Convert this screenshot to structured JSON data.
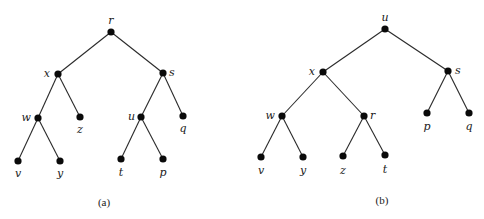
{
  "diagram": {
    "type": "binary-trees",
    "trees": [
      {
        "id": "a",
        "caption": "(a)",
        "caption_pos": [
          104,
          206
        ],
        "nodes": [
          {
            "id": "r",
            "label": "r",
            "x": 111,
            "y": 32,
            "lx": 111,
            "ly": 24,
            "anchor": "middle"
          },
          {
            "id": "x",
            "label": "x",
            "x": 58,
            "y": 74,
            "lx": 50,
            "ly": 77,
            "anchor": "end"
          },
          {
            "id": "s",
            "label": "s",
            "x": 163,
            "y": 73,
            "lx": 169,
            "ly": 76,
            "anchor": "start"
          },
          {
            "id": "w",
            "label": "w",
            "x": 38,
            "y": 118,
            "lx": 31,
            "ly": 121,
            "anchor": "end"
          },
          {
            "id": "z",
            "label": "z",
            "x": 80,
            "y": 117,
            "lx": 80,
            "ly": 133,
            "anchor": "middle"
          },
          {
            "id": "u",
            "label": "u",
            "x": 141,
            "y": 117,
            "lx": 135,
            "ly": 120,
            "anchor": "end"
          },
          {
            "id": "q",
            "label": "q",
            "x": 183,
            "y": 116,
            "lx": 183,
            "ly": 132,
            "anchor": "middle"
          },
          {
            "id": "v",
            "label": "v",
            "x": 18,
            "y": 161,
            "lx": 18,
            "ly": 177,
            "anchor": "middle"
          },
          {
            "id": "y",
            "label": "y",
            "x": 60,
            "y": 161,
            "lx": 60,
            "ly": 177,
            "anchor": "middle"
          },
          {
            "id": "t",
            "label": "t",
            "x": 121,
            "y": 159,
            "lx": 121,
            "ly": 176,
            "anchor": "middle"
          },
          {
            "id": "p",
            "label": "p",
            "x": 163,
            "y": 159,
            "lx": 163,
            "ly": 176,
            "anchor": "middle"
          }
        ],
        "edges": [
          [
            "r",
            "x"
          ],
          [
            "r",
            "s"
          ],
          [
            "x",
            "w"
          ],
          [
            "x",
            "z"
          ],
          [
            "w",
            "v"
          ],
          [
            "w",
            "y"
          ],
          [
            "s",
            "u"
          ],
          [
            "s",
            "q"
          ],
          [
            "u",
            "t"
          ],
          [
            "u",
            "p"
          ]
        ]
      },
      {
        "id": "b",
        "caption": "(b)",
        "caption_pos": [
          382,
          204
        ],
        "nodes": [
          {
            "id": "u",
            "label": "u",
            "x": 385,
            "y": 29,
            "lx": 385,
            "ly": 21,
            "anchor": "middle"
          },
          {
            "id": "x",
            "label": "x",
            "x": 323,
            "y": 72,
            "lx": 315,
            "ly": 75,
            "anchor": "end"
          },
          {
            "id": "s",
            "label": "s",
            "x": 448,
            "y": 71,
            "lx": 455,
            "ly": 74,
            "anchor": "start"
          },
          {
            "id": "w",
            "label": "w",
            "x": 282,
            "y": 116,
            "lx": 275,
            "ly": 119,
            "anchor": "end"
          },
          {
            "id": "r",
            "label": "r",
            "x": 364,
            "y": 116,
            "lx": 370,
            "ly": 119,
            "anchor": "start"
          },
          {
            "id": "p",
            "label": "p",
            "x": 427,
            "y": 113,
            "lx": 427,
            "ly": 130,
            "anchor": "middle"
          },
          {
            "id": "q",
            "label": "q",
            "x": 469,
            "y": 113,
            "lx": 469,
            "ly": 130,
            "anchor": "middle"
          },
          {
            "id": "v",
            "label": "v",
            "x": 261,
            "y": 157,
            "lx": 261,
            "ly": 174,
            "anchor": "middle"
          },
          {
            "id": "y",
            "label": "y",
            "x": 303,
            "y": 157,
            "lx": 303,
            "ly": 174,
            "anchor": "middle"
          },
          {
            "id": "z",
            "label": "z",
            "x": 343,
            "y": 156,
            "lx": 343,
            "ly": 174,
            "anchor": "middle"
          },
          {
            "id": "t",
            "label": "t",
            "x": 385,
            "y": 155,
            "lx": 385,
            "ly": 173,
            "anchor": "middle"
          }
        ],
        "edges": [
          [
            "u",
            "x"
          ],
          [
            "u",
            "s"
          ],
          [
            "x",
            "w"
          ],
          [
            "x",
            "r"
          ],
          [
            "w",
            "v"
          ],
          [
            "w",
            "y"
          ],
          [
            "r",
            "z"
          ],
          [
            "r",
            "t"
          ],
          [
            "s",
            "p"
          ],
          [
            "s",
            "q"
          ]
        ]
      }
    ]
  }
}
